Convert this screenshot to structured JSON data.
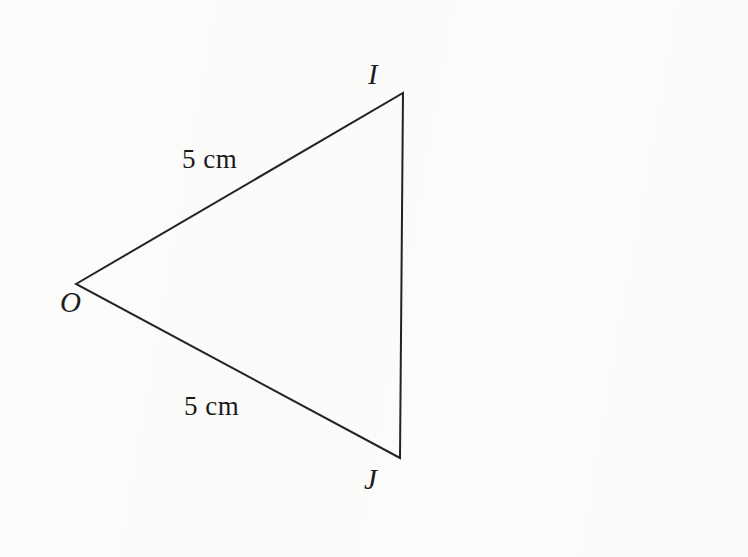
{
  "figure": {
    "kind": "geometry-diagram",
    "shape": "triangle",
    "background_color": "#fbfbfa",
    "stroke_color": "#232323",
    "stroke_width": 2,
    "canvas": {
      "width": 748,
      "height": 557
    }
  },
  "vertices": [
    {
      "id": "O",
      "label": "O",
      "x": 76,
      "y": 284,
      "label_x": 60,
      "label_y": 288
    },
    {
      "id": "I",
      "label": "I",
      "x": 403,
      "y": 93,
      "label_x": 368,
      "label_y": 60
    },
    {
      "id": "J",
      "label": "J",
      "x": 400,
      "y": 458,
      "label_x": 364,
      "label_y": 465
    }
  ],
  "edges": [
    {
      "id": "OI",
      "from": "O",
      "to": "I",
      "length_label": "5 cm",
      "label_x": 182,
      "label_y": 146
    },
    {
      "id": "IJ",
      "from": "I",
      "to": "J",
      "length_label": ""
    },
    {
      "id": "JO",
      "from": "J",
      "to": "O",
      "length_label": "5 cm",
      "label_x": 184,
      "label_y": 393
    }
  ],
  "labels": {
    "vertex_O": "O",
    "vertex_I": "I",
    "vertex_J": "J",
    "length_OI": "5 cm",
    "length_OJ": "5 cm"
  }
}
